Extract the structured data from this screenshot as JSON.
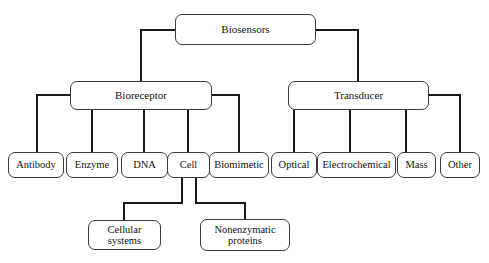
{
  "diagram": {
    "type": "hierarchy-tree",
    "orientation": "top-down",
    "background_color": "#ffffff",
    "line_color": "#1a1a1a",
    "box_border_color": "#3a3a3a",
    "nodes": {
      "root": {
        "label": "Biosensors",
        "x": 175,
        "y": 14,
        "w": 141,
        "h": 31
      },
      "bioreceptor": {
        "label": "Bioreceptor",
        "x": 70,
        "y": 81,
        "w": 142,
        "h": 29
      },
      "transducer": {
        "label": "Transducer",
        "x": 288,
        "y": 81,
        "w": 141,
        "h": 29
      },
      "antibody": {
        "label": "Antibody",
        "x": 8,
        "y": 152,
        "w": 56,
        "h": 26
      },
      "enzyme": {
        "label": "Enzyme",
        "x": 66,
        "y": 152,
        "w": 52,
        "h": 26
      },
      "dna": {
        "label": "DNA",
        "x": 121,
        "y": 152,
        "w": 47,
        "h": 26
      },
      "cell": {
        "label": "Cell",
        "x": 167,
        "y": 152,
        "w": 43,
        "h": 26
      },
      "biomimetic": {
        "label": "Biomimetic",
        "x": 209,
        "y": 152,
        "w": 60,
        "h": 26
      },
      "optical": {
        "label": "Optical",
        "x": 271,
        "y": 152,
        "w": 46,
        "h": 26
      },
      "electrochemical": {
        "label": "Electrochemical",
        "x": 317,
        "y": 152,
        "w": 79,
        "h": 26
      },
      "mass": {
        "label": "Mass",
        "x": 397,
        "y": 152,
        "w": 39,
        "h": 26
      },
      "other": {
        "label": "Other",
        "x": 440,
        "y": 152,
        "w": 40,
        "h": 26
      },
      "cellular_systems": {
        "label": "Cellular systems",
        "x": 88,
        "y": 220,
        "w": 73,
        "h": 30
      },
      "nonenzymatic_proteins": {
        "label": "Nonenzymatic\nproteins",
        "x": 200,
        "y": 219,
        "w": 90,
        "h": 32
      }
    },
    "edges": [
      {
        "from": "root",
        "to": "bioreceptor"
      },
      {
        "from": "root",
        "to": "transducer"
      },
      {
        "from": "bioreceptor",
        "to": "antibody"
      },
      {
        "from": "bioreceptor",
        "to": "enzyme"
      },
      {
        "from": "bioreceptor",
        "to": "dna"
      },
      {
        "from": "bioreceptor",
        "to": "cell"
      },
      {
        "from": "bioreceptor",
        "to": "biomimetic"
      },
      {
        "from": "transducer",
        "to": "optical"
      },
      {
        "from": "transducer",
        "to": "electrochemical"
      },
      {
        "from": "transducer",
        "to": "mass"
      },
      {
        "from": "transducer",
        "to": "other"
      },
      {
        "from": "cell",
        "to": "cellular_systems"
      },
      {
        "from": "cell",
        "to": "nonenzymatic_proteins"
      }
    ]
  }
}
